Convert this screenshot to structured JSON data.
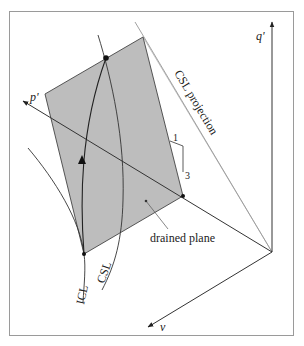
{
  "figure": {
    "labels": {
      "p_axis": "p'",
      "q_axis": "q'",
      "v_axis": "v",
      "csl_projection": "CSL projection",
      "drained_plane": "drained plane",
      "icl": "ICL",
      "csl": "CSL",
      "slope_run": "1",
      "slope_rise": "3"
    },
    "colors": {
      "plane_fill": "#bdbdbd",
      "line": "#333333",
      "light_line": "#8a8a8a",
      "frame": "#9a9a9a"
    }
  }
}
